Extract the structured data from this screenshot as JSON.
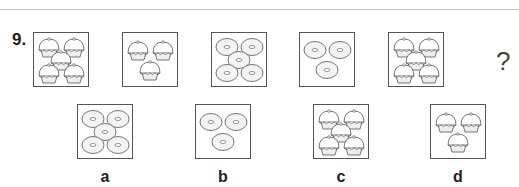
{
  "question": {
    "number": "9.",
    "sequence": [
      {
        "item": "cupcake",
        "count": 5
      },
      {
        "item": "cupcake",
        "count": 3
      },
      {
        "item": "donut",
        "count": 5
      },
      {
        "item": "donut",
        "count": 3
      },
      {
        "item": "cupcake",
        "count": 5
      }
    ],
    "unknown": "?"
  },
  "options": [
    {
      "label": "a",
      "item": "donut",
      "count": 5
    },
    {
      "label": "b",
      "item": "donut",
      "count": 3
    },
    {
      "label": "c",
      "item": "cupcake",
      "count": 5
    },
    {
      "label": "d",
      "item": "cupcake",
      "count": 3
    }
  ]
}
